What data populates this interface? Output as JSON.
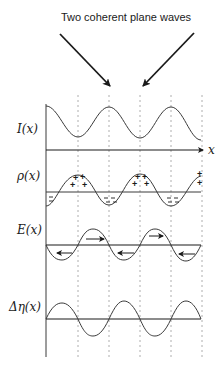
{
  "title": "Two coherent plane waves",
  "axis_label": "x",
  "panels": [
    {
      "id": "intensity",
      "label": "I(x)",
      "description": "Interference intensity, cosine-like fringes"
    },
    {
      "id": "charge",
      "label": "ρ(x)",
      "description": "Charge density, + at fringe maxima, − at minima"
    },
    {
      "id": "field",
      "label": "E(x)",
      "description": "Space-charge field with direction arrows"
    },
    {
      "id": "index",
      "label": "Δη(x)",
      "description": "Refractive index modulation"
    }
  ],
  "charge_signs": {
    "positive": "+",
    "negative": "−"
  },
  "colors": {
    "line": "#3a3a3a",
    "dashed": "#9a9a9a",
    "background": "#ffffff"
  }
}
